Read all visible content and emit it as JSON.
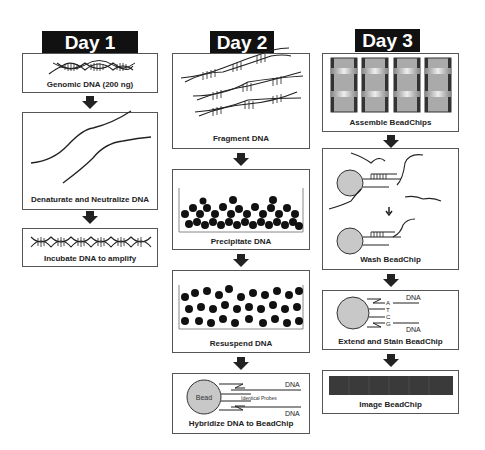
{
  "columns": [
    {
      "header": "Day 1",
      "steps": [
        {
          "caption": "Genomic DNA (200 ng)",
          "icon": "dna-helix-icon"
        },
        {
          "caption": "Denaturate and Neutralize DNA",
          "icon": "single-strand-dna-icon"
        },
        {
          "caption": "Incubate DNA to amplify",
          "icon": "dna-helix-long-icon"
        }
      ]
    },
    {
      "header": "Day 2",
      "steps": [
        {
          "caption": "Fragment DNA",
          "icon": "fragmented-dna-icon"
        },
        {
          "caption": "Precipitate DNA",
          "icon": "precipitate-icon"
        },
        {
          "caption": "Resuspend DNA",
          "icon": "resuspend-icon"
        },
        {
          "caption": "Hybridize DNA to BeadChip",
          "icon": "bead-hybridize-icon",
          "labels": {
            "bead": "Bead",
            "probes": "Identical Probes",
            "dna_top": "DNA",
            "dna_bottom": "DNA"
          }
        }
      ]
    },
    {
      "header": "Day 3",
      "steps": [
        {
          "caption": "Assemble BeadChips",
          "icon": "beadchip-assembly-icon"
        },
        {
          "caption": "Wash BeadChip",
          "icon": "wash-bead-icon"
        },
        {
          "caption": "Extend and Stain BeadChip",
          "icon": "extend-stain-icon",
          "labels": {
            "dna_top": "DNA",
            "dna_bottom": "DNA",
            "bases": [
              "A",
              "T",
              "C",
              "G"
            ]
          }
        },
        {
          "caption": "Image BeadChip",
          "icon": "image-chip-icon"
        }
      ]
    }
  ],
  "colors": {
    "header_bg": "#111111",
    "header_text": "#ffffff",
    "bead_fill": "#c8c8c8",
    "border": "#555555"
  }
}
